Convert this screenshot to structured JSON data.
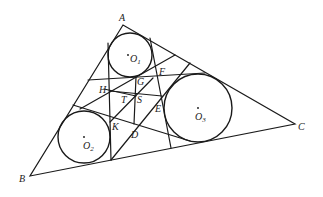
{
  "diagram": {
    "title": "",
    "vertices": {
      "A": {
        "label": "A",
        "x": 123,
        "y": 25
      },
      "B": {
        "label": "B",
        "x": 30,
        "y": 176
      },
      "C": {
        "label": "C",
        "x": 295,
        "y": 124
      }
    },
    "circles": [
      {
        "name": "O1",
        "label": "O",
        "sub": "1",
        "cx": 130,
        "cy": 55,
        "r": 22
      },
      {
        "name": "O2",
        "label": "O",
        "sub": "2",
        "cx": 84,
        "cy": 137,
        "r": 26
      },
      {
        "name": "O3",
        "label": "O",
        "sub": "3",
        "cx": 198,
        "cy": 108,
        "r": 34
      }
    ],
    "points": {
      "F": {
        "label": "F",
        "x": 162,
        "y": 70
      },
      "G": {
        "label": "G",
        "x": 136,
        "y": 78
      },
      "H": {
        "label": "H",
        "x": 104,
        "y": 89
      },
      "T": {
        "label": "T",
        "x": 124,
        "y": 96
      },
      "S": {
        "label": "S",
        "x": 136,
        "y": 96
      },
      "E": {
        "label": "E",
        "x": 160,
        "y": 104
      },
      "K": {
        "label": "K",
        "x": 110,
        "y": 122
      },
      "D": {
        "label": "D",
        "x": 133,
        "y": 124
      }
    }
  }
}
